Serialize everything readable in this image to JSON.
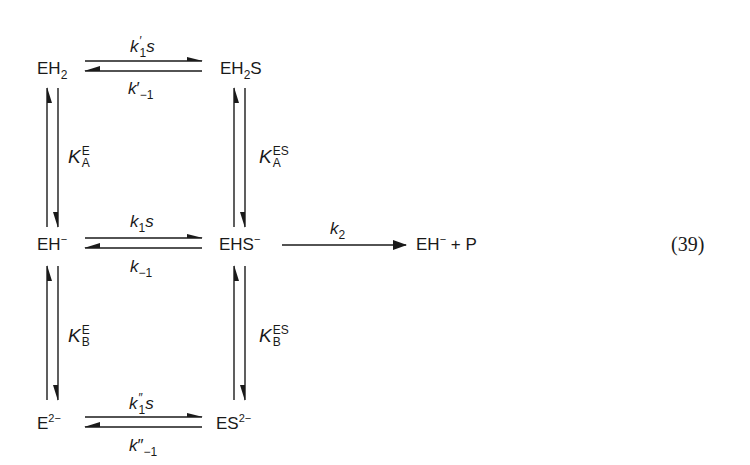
{
  "species": {
    "eh2": {
      "base": "EH",
      "sub": "2",
      "sup": ""
    },
    "eh2s": {
      "base": "EH",
      "sub": "2",
      "tail": "S"
    },
    "eh": {
      "base": "EH",
      "sup": "−"
    },
    "ehs": {
      "base": "EHS",
      "sup": "−"
    },
    "e2": {
      "base": "E",
      "sup": "2−"
    },
    "es2": {
      "base": "ES",
      "sup": "2−"
    },
    "product": {
      "base": "EH",
      "sup": "−",
      "tail": " + P"
    }
  },
  "rates": {
    "top_forward": {
      "k": "k",
      "prime": "′",
      "sub": "1",
      "tail": "s"
    },
    "top_reverse": {
      "k": "k",
      "prime": "′",
      "sub": "−1"
    },
    "mid_forward": {
      "k": "k",
      "sub": "1",
      "tail": "s"
    },
    "mid_reverse": {
      "k": "k",
      "sub": "−1"
    },
    "bot_forward": {
      "k": "k",
      "prime": "″",
      "sub": "1",
      "tail": "s"
    },
    "bot_reverse": {
      "k": "k",
      "prime": "″",
      "sub": "−1"
    },
    "catalytic": {
      "k": "k",
      "sub": "2"
    }
  },
  "constants": {
    "left_upper": {
      "K": "K",
      "sup": "E",
      "sub": "A"
    },
    "right_upper": {
      "K": "K",
      "sup": "ES",
      "sub": "A"
    },
    "left_lower": {
      "K": "K",
      "sup": "E",
      "sub": "B"
    },
    "right_lower": {
      "K": "K",
      "sup": "ES",
      "sub": "B"
    }
  },
  "equation_number": "(39)",
  "colors": {
    "ink": "#1a1a1a",
    "background": "#ffffff"
  }
}
